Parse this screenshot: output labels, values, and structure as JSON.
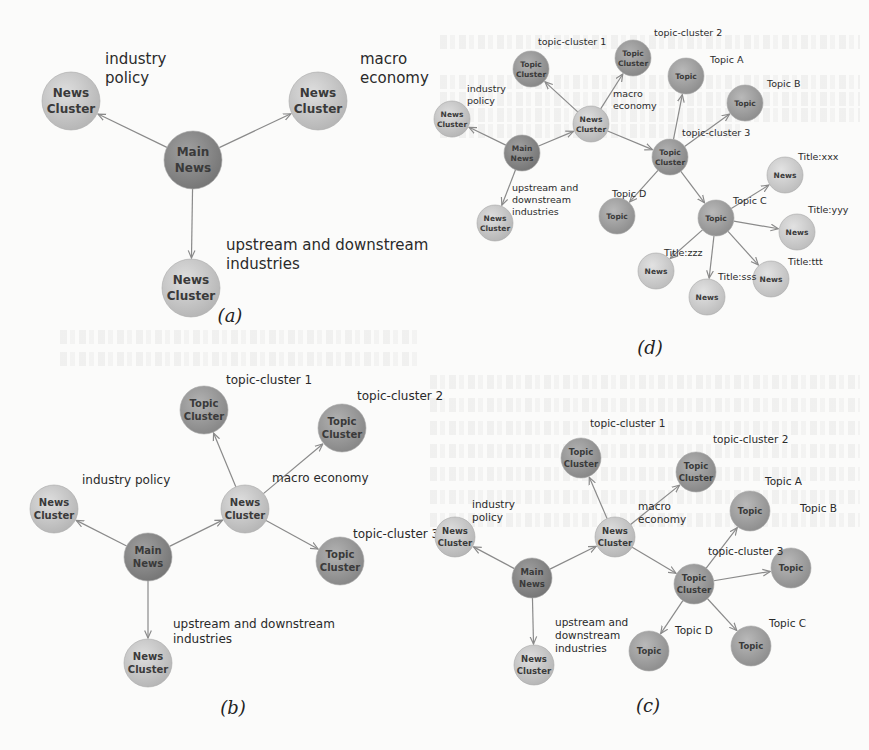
{
  "colors": {
    "news_cluster": "#c9c9c9",
    "main_news": "#8d8d8d",
    "topic_cluster": "#9a9a9a",
    "topic": "#a2a2a2",
    "news": "#cfcfcf",
    "edge": "#8a8a8a"
  },
  "node_labels": {
    "news_cluster": [
      "News",
      "Cluster"
    ],
    "main_news": [
      "Main",
      "News"
    ],
    "topic_cluster": [
      "Topic",
      "Cluster"
    ],
    "topic": [
      "Topic"
    ],
    "news": [
      "News"
    ]
  },
  "panels": [
    {
      "id": "a",
      "caption": "(a)",
      "nodes": [
        {
          "id": "main",
          "type": "main_news"
        },
        {
          "id": "nc_policy",
          "type": "news_cluster"
        },
        {
          "id": "nc_macro",
          "type": "news_cluster"
        },
        {
          "id": "nc_updown",
          "type": "news_cluster"
        }
      ],
      "edges": [
        [
          "main",
          "nc_policy"
        ],
        [
          "main",
          "nc_macro"
        ],
        [
          "main",
          "nc_updown"
        ]
      ],
      "labels": [
        {
          "id": "policy",
          "lines": [
            "industry",
            "policy"
          ]
        },
        {
          "id": "macro",
          "lines": [
            "macro",
            "economy"
          ]
        },
        {
          "id": "updown",
          "lines": [
            "upstream and downstream",
            "industries"
          ]
        }
      ]
    },
    {
      "id": "b",
      "caption": "(b)",
      "nodes": [
        {
          "id": "main",
          "type": "main_news"
        },
        {
          "id": "nc_policy",
          "type": "news_cluster"
        },
        {
          "id": "nc_macro",
          "type": "news_cluster"
        },
        {
          "id": "nc_updown",
          "type": "news_cluster"
        },
        {
          "id": "tc1",
          "type": "topic_cluster"
        },
        {
          "id": "tc2",
          "type": "topic_cluster"
        },
        {
          "id": "tc3",
          "type": "topic_cluster"
        }
      ],
      "edges": [
        [
          "main",
          "nc_policy"
        ],
        [
          "main",
          "nc_macro"
        ],
        [
          "main",
          "nc_updown"
        ],
        [
          "nc_macro",
          "tc1"
        ],
        [
          "nc_macro",
          "tc2"
        ],
        [
          "nc_macro",
          "tc3"
        ]
      ],
      "labels": [
        {
          "id": "policy",
          "lines": [
            "industry policy"
          ]
        },
        {
          "id": "macro",
          "lines": [
            "macro economy"
          ]
        },
        {
          "id": "updown",
          "lines": [
            "upstream and downstream",
            "industries"
          ]
        },
        {
          "id": "tc1",
          "lines": [
            "topic-cluster 1"
          ]
        },
        {
          "id": "tc2",
          "lines": [
            "topic-cluster 2"
          ]
        },
        {
          "id": "tc3",
          "lines": [
            "topic-cluster 3"
          ]
        }
      ]
    },
    {
      "id": "c",
      "caption": "(c)",
      "nodes": [
        {
          "id": "main",
          "type": "main_news"
        },
        {
          "id": "nc_policy",
          "type": "news_cluster"
        },
        {
          "id": "nc_macro",
          "type": "news_cluster"
        },
        {
          "id": "nc_updown",
          "type": "news_cluster"
        },
        {
          "id": "tc1",
          "type": "topic_cluster"
        },
        {
          "id": "tc2",
          "type": "topic_cluster"
        },
        {
          "id": "tc3",
          "type": "topic_cluster"
        },
        {
          "id": "tA",
          "type": "topic"
        },
        {
          "id": "tB",
          "type": "topic"
        },
        {
          "id": "tC",
          "type": "topic"
        },
        {
          "id": "tD",
          "type": "topic"
        }
      ],
      "edges": [
        [
          "main",
          "nc_policy"
        ],
        [
          "main",
          "nc_macro"
        ],
        [
          "main",
          "nc_updown"
        ],
        [
          "nc_macro",
          "tc1"
        ],
        [
          "nc_macro",
          "tc2"
        ],
        [
          "nc_macro",
          "tc3"
        ],
        [
          "tc3",
          "tA"
        ],
        [
          "tc3",
          "tB"
        ],
        [
          "tc3",
          "tC"
        ],
        [
          "tc3",
          "tD"
        ]
      ],
      "labels": [
        {
          "id": "policy",
          "lines": [
            "industry",
            "policy"
          ]
        },
        {
          "id": "macro",
          "lines": [
            "macro",
            "economy"
          ]
        },
        {
          "id": "updown",
          "lines": [
            "upstream and",
            "downstream",
            "industries"
          ]
        },
        {
          "id": "tc1",
          "lines": [
            "topic-cluster 1"
          ]
        },
        {
          "id": "tc2",
          "lines": [
            "topic-cluster 2"
          ]
        },
        {
          "id": "tc3",
          "lines": [
            "topic-cluster 3"
          ]
        },
        {
          "id": "tA",
          "lines": [
            "Topic A"
          ]
        },
        {
          "id": "tB",
          "lines": [
            "Topic B"
          ]
        },
        {
          "id": "tC",
          "lines": [
            "Topic C"
          ]
        },
        {
          "id": "tD",
          "lines": [
            "Topic D"
          ]
        }
      ]
    },
    {
      "id": "d",
      "caption": "(d)",
      "nodes": [
        {
          "id": "main",
          "type": "main_news"
        },
        {
          "id": "nc_policy",
          "type": "news_cluster"
        },
        {
          "id": "nc_macro",
          "type": "news_cluster"
        },
        {
          "id": "nc_updown",
          "type": "news_cluster"
        },
        {
          "id": "tc1",
          "type": "topic_cluster"
        },
        {
          "id": "tc2",
          "type": "topic_cluster"
        },
        {
          "id": "tc3",
          "type": "topic_cluster"
        },
        {
          "id": "tA",
          "type": "topic"
        },
        {
          "id": "tB",
          "type": "topic"
        },
        {
          "id": "tC",
          "type": "topic"
        },
        {
          "id": "tD",
          "type": "topic"
        },
        {
          "id": "nxxx",
          "type": "news"
        },
        {
          "id": "nyyy",
          "type": "news"
        },
        {
          "id": "nttt",
          "type": "news"
        },
        {
          "id": "nsss",
          "type": "news"
        },
        {
          "id": "nzzz",
          "type": "news"
        }
      ],
      "edges": [
        [
          "main",
          "nc_policy"
        ],
        [
          "main",
          "nc_macro"
        ],
        [
          "main",
          "nc_updown"
        ],
        [
          "nc_macro",
          "tc1"
        ],
        [
          "nc_macro",
          "tc2"
        ],
        [
          "nc_macro",
          "tc3"
        ],
        [
          "tc3",
          "tA"
        ],
        [
          "tc3",
          "tB"
        ],
        [
          "tc3",
          "tC"
        ],
        [
          "tc3",
          "tD"
        ],
        [
          "tC",
          "nxxx"
        ],
        [
          "tC",
          "nyyy"
        ],
        [
          "tC",
          "nttt"
        ],
        [
          "tC",
          "nsss"
        ],
        [
          "tC",
          "nzzz"
        ]
      ],
      "labels": [
        {
          "id": "policy",
          "lines": [
            "industry",
            "policy"
          ]
        },
        {
          "id": "macro",
          "lines": [
            "macro",
            "economy"
          ]
        },
        {
          "id": "updown",
          "lines": [
            "upstream and",
            "downstream",
            "industries"
          ]
        },
        {
          "id": "tc1",
          "lines": [
            "topic-cluster 1"
          ]
        },
        {
          "id": "tc2",
          "lines": [
            "topic-cluster 2"
          ]
        },
        {
          "id": "tc3",
          "lines": [
            "topic-cluster 3"
          ]
        },
        {
          "id": "tA",
          "lines": [
            "Topic A"
          ]
        },
        {
          "id": "tB",
          "lines": [
            "Topic B"
          ]
        },
        {
          "id": "tC",
          "lines": [
            "Topic C"
          ]
        },
        {
          "id": "tD",
          "lines": [
            "Topic D"
          ]
        },
        {
          "id": "xxx",
          "lines": [
            "Title:xxx"
          ]
        },
        {
          "id": "yyy",
          "lines": [
            "Title:yyy"
          ]
        },
        {
          "id": "ttt",
          "lines": [
            "Title:ttt"
          ]
        },
        {
          "id": "sss",
          "lines": [
            "Title:sss"
          ]
        },
        {
          "id": "zzz",
          "lines": [
            "Title:zzz"
          ]
        }
      ]
    }
  ]
}
